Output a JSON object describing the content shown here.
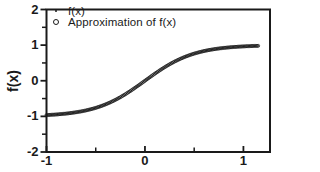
{
  "figure": {
    "background": "#ffffff",
    "ink_color": "#1a1a1a"
  },
  "chart_data": {
    "type": "scatter",
    "title": "",
    "xlabel": "",
    "ylabel": "f(x)",
    "xlim": [
      -1,
      1.27
    ],
    "ylim": [
      -2,
      2
    ],
    "xticks": [
      -1,
      0,
      1
    ],
    "xtick_labels": [
      "-1",
      "0",
      "1"
    ],
    "xticks_minor": [
      -0.5,
      0.5
    ],
    "yticks": [
      2,
      1,
      0,
      -1,
      -2
    ],
    "ytick_labels": [
      "2",
      "1",
      "0",
      "-1",
      "-2"
    ],
    "yticks_minor": [
      1.5,
      0.5,
      -0.5,
      -1.5
    ],
    "grid": false,
    "legend_position": "top-left-inside",
    "x": [
      -1,
      -0.95,
      -0.9,
      -0.85,
      -0.8,
      -0.75,
      -0.7,
      -0.65,
      -0.6,
      -0.55,
      -0.5,
      -0.45,
      -0.4,
      -0.35,
      -0.3,
      -0.25,
      -0.2,
      -0.15,
      -0.1,
      -0.05,
      0,
      0.05,
      0.1,
      0.15,
      0.2,
      0.25,
      0.3,
      0.35,
      0.4,
      0.45,
      0.5,
      0.55,
      0.6,
      0.65,
      0.7,
      0.75,
      0.8,
      0.85,
      0.9,
      0.95,
      1,
      1.05,
      1.1,
      1.15
    ],
    "series": [
      {
        "name": "f(x)",
        "marker": "dot",
        "y": [
          -0.964,
          -0.956,
          -0.947,
          -0.935,
          -0.922,
          -0.905,
          -0.885,
          -0.862,
          -0.834,
          -0.8,
          -0.762,
          -0.716,
          -0.664,
          -0.604,
          -0.537,
          -0.462,
          -0.38,
          -0.291,
          -0.197,
          -0.1,
          0,
          0.1,
          0.197,
          0.291,
          0.38,
          0.462,
          0.537,
          0.604,
          0.664,
          0.716,
          0.762,
          0.8,
          0.834,
          0.862,
          0.885,
          0.905,
          0.922,
          0.935,
          0.947,
          0.956,
          0.964,
          0.971,
          0.976,
          0.98
        ]
      },
      {
        "name": "Approximation of f(x)",
        "marker": "open-circle",
        "y": [
          -0.964,
          -0.956,
          -0.947,
          -0.935,
          -0.922,
          -0.905,
          -0.885,
          -0.862,
          -0.834,
          -0.8,
          -0.762,
          -0.716,
          -0.664,
          -0.604,
          -0.537,
          -0.462,
          -0.38,
          -0.291,
          -0.197,
          -0.1,
          0,
          0.1,
          0.197,
          0.291,
          0.38,
          0.462,
          0.537,
          0.604,
          0.664,
          0.716,
          0.762,
          0.8,
          0.834,
          0.862,
          0.885,
          0.905,
          0.922,
          0.935,
          0.947,
          0.956,
          0.964,
          0.971,
          0.976,
          0.98
        ]
      }
    ]
  }
}
